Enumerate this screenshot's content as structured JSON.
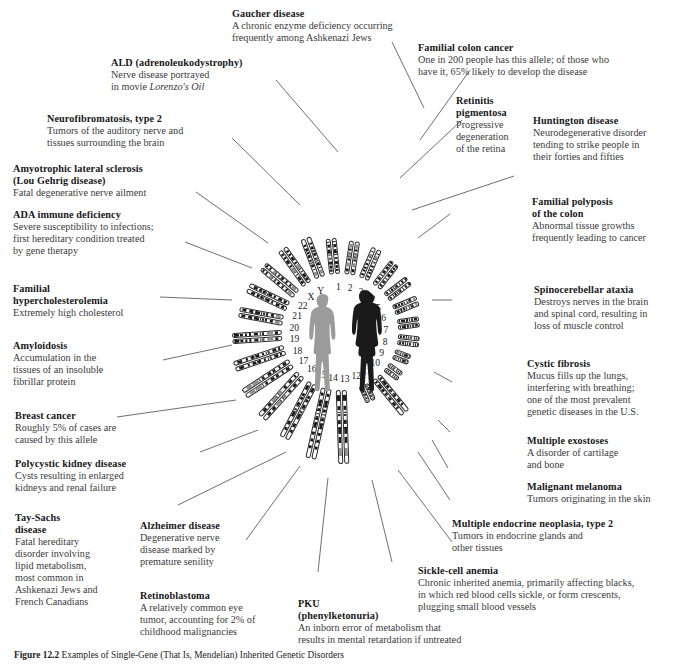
{
  "figure": {
    "caption_label": "Figure 12.2",
    "caption_text": "Examples of Single-Gene (That Is, Mendelian) Inherited Genetic Disorders"
  },
  "center": {
    "curved_label": "Chromosome pairs",
    "male_figure": "male-silhouette",
    "female_figure": "female-silhouette",
    "male_color": "#9b9b9b",
    "female_color": "#1a1a1a"
  },
  "chromosome_numbers": [
    "1",
    "2",
    "3",
    "4",
    "5",
    "6",
    "7",
    "8",
    "9",
    "10",
    "11",
    "12",
    "13",
    "14",
    "15",
    "16",
    "17",
    "18",
    "19",
    "20",
    "21",
    "22",
    "X",
    "Y"
  ],
  "annotations": [
    {
      "id": "gaucher",
      "title": "Gaucher disease",
      "lines": [
        "A chronic enzyme deficiency occurring",
        "frequently among Ashkenazi Jews"
      ],
      "align": "left"
    },
    {
      "id": "ald",
      "title": "ALD (adrenoleukodystrophy)",
      "lines": [
        "Nerve disease portrayed",
        "in movie <i>Lorenzo's Oil</i>"
      ],
      "align": "left"
    },
    {
      "id": "neurofibromatosis",
      "title": "Neurofibromatosis, type 2",
      "lines": [
        "Tumors of the auditory nerve and",
        "tissues surrounding the brain"
      ],
      "align": "left"
    },
    {
      "id": "als",
      "title": "Amyotrophic lateral sclerosis",
      "title2": "(Lou Gehrig disease)",
      "lines": [
        "Fatal degenerative nerve ailment"
      ],
      "align": "left"
    },
    {
      "id": "ada",
      "title": "ADA immune deficiency",
      "lines": [
        "Severe susceptibility to infections;",
        "first hereditary condition treated",
        "by gene therapy"
      ],
      "align": "left"
    },
    {
      "id": "hypercholesterolemia",
      "title": "Familial",
      "title2": "hypercholesterolemia",
      "lines": [
        "Extremely high cholesterol"
      ],
      "align": "left"
    },
    {
      "id": "amyloidosis",
      "title": "Amyloidosis",
      "lines": [
        "Accumulation in the",
        "tissues of an insoluble",
        "fibrillar protein"
      ],
      "align": "left"
    },
    {
      "id": "breast-cancer",
      "title": "Breast cancer",
      "lines": [
        "Roughly 5% of cases are",
        "caused by this allele"
      ],
      "align": "left"
    },
    {
      "id": "polycystic-kidney",
      "title": "Polycystic kidney disease",
      "lines": [
        "Cysts resulting in enlarged",
        "kidneys and renal failure"
      ],
      "align": "left"
    },
    {
      "id": "tay-sachs",
      "title": "Tay-Sachs",
      "title2": "disease",
      "lines": [
        "Fatal hereditary",
        "disorder involving",
        "lipid metabolism,",
        "most common in",
        "Ashkenazi Jews and",
        "French Canadians"
      ],
      "align": "left"
    },
    {
      "id": "alzheimer",
      "title": "Alzheimer disease",
      "lines": [
        "Degenerative nerve",
        "disease marked by",
        "premature senility"
      ],
      "align": "left"
    },
    {
      "id": "retinoblastoma",
      "title": "Retinoblastoma",
      "lines": [
        "A relatively common eye",
        "tumor, accounting for 2% of",
        "childhood malignancies"
      ],
      "align": "left"
    },
    {
      "id": "pku",
      "title": "PKU",
      "title2": "(phenylketonuria)",
      "lines": [
        "An inborn error of metabolism that",
        "results in mental retardation if untreated"
      ],
      "align": "left"
    },
    {
      "id": "sickle-cell",
      "title": "Sickle-cell anemia",
      "lines": [
        "Chronic inherited anemia, primarily affecting blacks,",
        "in which red blood cells sickle, or form crescents,",
        "plugging small blood vessels"
      ],
      "align": "left"
    },
    {
      "id": "men2",
      "title": "Multiple endocrine neoplasia, type 2",
      "lines": [
        "Tumors in endocrine glands and",
        "other tissues"
      ],
      "align": "left"
    },
    {
      "id": "melanoma",
      "title": "Malignant melanoma",
      "lines": [
        "Tumors originating in the skin"
      ],
      "align": "left"
    },
    {
      "id": "exostoses",
      "title": "Multiple exostoses",
      "lines": [
        "A disorder of cartilage",
        "and bone"
      ],
      "align": "left"
    },
    {
      "id": "cystic-fibrosis",
      "title": "Cystic fibrosis",
      "lines": [
        "Mucus fills up the lungs,",
        "interfering with breathing;",
        "one of the most prevalent",
        "genetic diseases in the U.S."
      ],
      "align": "left"
    },
    {
      "id": "spinocerebellar",
      "title": "Spinocerebellar ataxia",
      "lines": [
        "Destroys nerves in the brain",
        "and spinal cord, resulting in",
        "loss of muscle control"
      ],
      "align": "left"
    },
    {
      "id": "polyposis",
      "title": "Familial polyposis",
      "title2": "of the colon",
      "lines": [
        "Abnormal tissue growths",
        "frequently leading to cancer"
      ],
      "align": "left"
    },
    {
      "id": "huntington",
      "title": "Huntington disease",
      "lines": [
        "Neurodegenerative disorder",
        "tending to strike people in",
        "their forties and fifties"
      ],
      "align": "left"
    },
    {
      "id": "retinitis",
      "title": "Retinitis",
      "title2": "pigmentosa",
      "lines": [
        "Progressive",
        "degeneration",
        "of the retina"
      ],
      "align": "left"
    },
    {
      "id": "colon-cancer",
      "title": "Familial colon cancer",
      "lines": [
        "One in 200 people has this allele; of those who",
        "have it, 65% likely to develop the disease"
      ],
      "align": "left"
    }
  ]
}
